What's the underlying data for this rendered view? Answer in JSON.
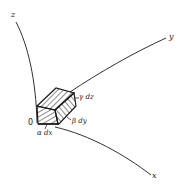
{
  "figure": {
    "axes": {
      "x_label": "x",
      "y_label": "y",
      "z_label": "z",
      "origin_label": "0"
    },
    "element_labels": {
      "alpha": "α dx",
      "beta": "β dy",
      "gamma": "γ dz"
    },
    "colors": {
      "ink": "#1a1a1a",
      "background": "#ffffff"
    }
  }
}
